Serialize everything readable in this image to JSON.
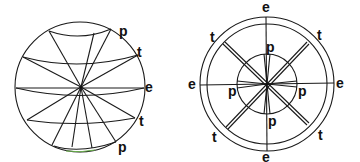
{
  "left_diagram": {
    "labels": [
      {
        "id": "p_top",
        "text": "p"
      },
      {
        "id": "t_top",
        "text": "t"
      },
      {
        "id": "e_right",
        "text": "e"
      },
      {
        "id": "t_bottom",
        "text": "t"
      },
      {
        "id": "p_bottom",
        "text": "p"
      }
    ]
  },
  "right_diagram": {
    "labels": [
      {
        "id": "e_top",
        "text": "e"
      },
      {
        "id": "e_left",
        "text": "e"
      },
      {
        "id": "e_right",
        "text": "e"
      },
      {
        "id": "e_bottom",
        "text": "e"
      },
      {
        "id": "t_tl",
        "text": "t"
      },
      {
        "id": "t_tr",
        "text": "t"
      },
      {
        "id": "t_bl",
        "text": "t"
      },
      {
        "id": "t_br",
        "text": "t"
      },
      {
        "id": "p_top",
        "text": "p"
      },
      {
        "id": "p_left",
        "text": "p"
      },
      {
        "id": "p_right",
        "text": "p"
      },
      {
        "id": "p_bottom",
        "text": "p"
      }
    ]
  }
}
